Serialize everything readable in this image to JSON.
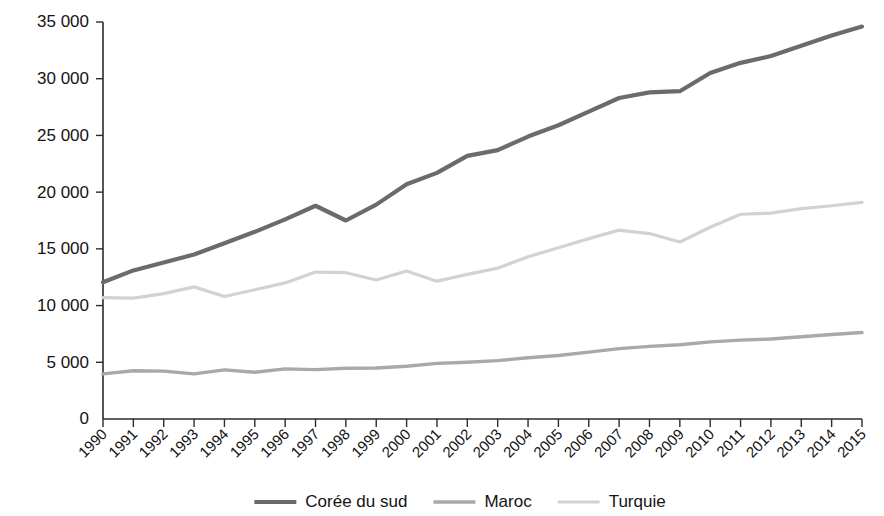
{
  "chart_data": {
    "type": "line",
    "title": "",
    "subtitle": "",
    "xlabel": "",
    "ylabel": "",
    "grid": false,
    "legend_position": "bottom",
    "xlim": [
      1990,
      2015
    ],
    "ylim": [
      0,
      35000
    ],
    "y_ticks": [
      0,
      5000,
      10000,
      15000,
      20000,
      25000,
      30000,
      35000
    ],
    "y_tick_labels": [
      "0",
      "5 000",
      "10 000",
      "15 000",
      "20 000",
      "25 000",
      "30 000",
      "35 000"
    ],
    "categories": [
      "1990",
      "1991",
      "1992",
      "1993",
      "1994",
      "1995",
      "1996",
      "1997",
      "1998",
      "1999",
      "2000",
      "2001",
      "2002",
      "2003",
      "2004",
      "2005",
      "2006",
      "2007",
      "2008",
      "2009",
      "2010",
      "2011",
      "2012",
      "2013",
      "2014",
      "2015"
    ],
    "x": [
      1990,
      1991,
      1992,
      1993,
      1994,
      1995,
      1996,
      1997,
      1998,
      1999,
      2000,
      2001,
      2002,
      2003,
      2004,
      2005,
      2006,
      2007,
      2008,
      2009,
      2010,
      2011,
      2012,
      2013,
      2014,
      2015
    ],
    "series": [
      {
        "name": "Corée du sud",
        "color": "#6b6b6b",
        "width": 4.2,
        "values": [
          12050,
          13100,
          13800,
          14500,
          15500,
          16500,
          17600,
          18800,
          17500,
          18900,
          20700,
          21700,
          23200,
          23700,
          24900,
          25900,
          27100,
          28300,
          28800,
          28900,
          30500,
          31400,
          32000,
          32900,
          33800,
          34600
        ]
      },
      {
        "name": "Maroc",
        "color": "#a9a9a9",
        "width": 3.4,
        "values": [
          3980,
          4250,
          4220,
          3980,
          4330,
          4120,
          4420,
          4350,
          4480,
          4500,
          4650,
          4900,
          5000,
          5150,
          5400,
          5600,
          5900,
          6200,
          6400,
          6550,
          6800,
          6950,
          7050,
          7250,
          7450,
          7620
        ]
      },
      {
        "name": "Turquie",
        "color": "#d2d2d2",
        "width": 3.2,
        "values": [
          10700,
          10650,
          11050,
          11650,
          10800,
          11400,
          12000,
          12950,
          12900,
          12250,
          13050,
          12150,
          12750,
          13300,
          14300,
          15100,
          15900,
          16650,
          16350,
          15600,
          16900,
          18050,
          18150,
          18550,
          18800,
          19100
        ]
      }
    ],
    "annotations": []
  },
  "legend": {
    "entries": [
      {
        "label": "Corée du sud"
      },
      {
        "label": "Maroc"
      },
      {
        "label": "Turquie"
      }
    ]
  }
}
